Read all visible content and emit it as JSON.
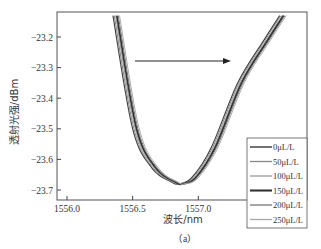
{
  "chart_data": {
    "type": "line",
    "title": "",
    "caption": "（a）",
    "xlabel": "波长/nm",
    "ylabel": "透射光强/dBm",
    "xlim": [
      1555.92,
      1557.82
    ],
    "ylim": [
      -23.125,
      -23.74
    ],
    "xticks": [
      1556.0,
      1556.5,
      1557.0,
      1557.5
    ],
    "xtick_labels": [
      "1556.0",
      "1556.5",
      "1557.0",
      "1557.5"
    ],
    "yticks": [
      -23.2,
      -23.3,
      -23.4,
      -23.5,
      -23.6,
      -23.7
    ],
    "ytick_labels": [
      "−23.2",
      "−23.3",
      "−23.4",
      "−23.5",
      "−23.6",
      "−23.7"
    ],
    "grid": false,
    "legend_position": "lower right",
    "annotation": "arrow pointing right (red-shift with increasing concentration)",
    "series": [
      {
        "name": "0μL/L",
        "color": "#444444",
        "width": 1.2,
        "x": [
          1556.35,
          1556.5,
          1556.65,
          1556.8,
          1556.85,
          1556.95,
          1557.1,
          1557.3,
          1557.5,
          1557.62
        ],
        "y": [
          -23.13,
          -23.5,
          -23.63,
          -23.675,
          -23.68,
          -23.66,
          -23.56,
          -23.35,
          -23.21,
          -23.13
        ]
      },
      {
        "name": "50μL/L",
        "color": "#888888",
        "width": 1.0,
        "x": [
          1556.36,
          1556.51,
          1556.66,
          1556.81,
          1556.86,
          1556.96,
          1557.11,
          1557.31,
          1557.51,
          1557.63
        ],
        "y": [
          -23.13,
          -23.5,
          -23.63,
          -23.675,
          -23.68,
          -23.66,
          -23.56,
          -23.35,
          -23.21,
          -23.13
        ]
      },
      {
        "name": "100μL/L",
        "color": "#999999",
        "width": 1.0,
        "x": [
          1556.37,
          1556.52,
          1556.67,
          1556.82,
          1556.87,
          1556.97,
          1557.12,
          1557.32,
          1557.52,
          1557.64
        ],
        "y": [
          -23.13,
          -23.5,
          -23.63,
          -23.675,
          -23.68,
          -23.66,
          -23.56,
          -23.35,
          -23.21,
          -23.13
        ]
      },
      {
        "name": "150μL/L",
        "color": "#333333",
        "width": 1.8,
        "x": [
          1556.38,
          1556.53,
          1556.68,
          1556.83,
          1556.88,
          1556.98,
          1557.13,
          1557.33,
          1557.53,
          1557.65
        ],
        "y": [
          -23.13,
          -23.5,
          -23.63,
          -23.675,
          -23.68,
          -23.66,
          -23.56,
          -23.35,
          -23.21,
          -23.13
        ]
      },
      {
        "name": "200μL/L",
        "color": "#777777",
        "width": 1.0,
        "x": [
          1556.39,
          1556.54,
          1556.69,
          1556.84,
          1556.89,
          1556.99,
          1557.14,
          1557.34,
          1557.54,
          1557.66
        ],
        "y": [
          -23.13,
          -23.5,
          -23.63,
          -23.675,
          -23.68,
          -23.66,
          -23.56,
          -23.35,
          -23.21,
          -23.13
        ]
      },
      {
        "name": "250μL/L",
        "color": "#aaaaaa",
        "width": 1.0,
        "x": [
          1556.4,
          1556.55,
          1556.7,
          1556.85,
          1556.9,
          1557.0,
          1557.15,
          1557.35,
          1557.55,
          1557.67
        ],
        "y": [
          -23.13,
          -23.5,
          -23.63,
          -23.675,
          -23.68,
          -23.66,
          -23.56,
          -23.35,
          -23.21,
          -23.13
        ]
      }
    ]
  }
}
